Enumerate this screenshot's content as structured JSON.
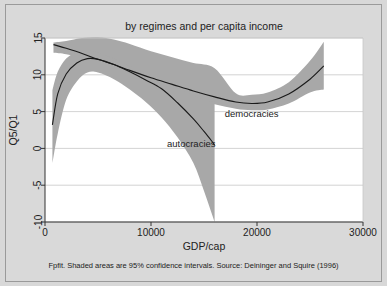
{
  "figure": {
    "title": "by regimes and per capita income",
    "note": "Fpfit. Shaded areas are 95% confidence intervals. Source: Deininger and Squire (1996)",
    "background_color": "#d9d9d9",
    "plot_background_color": "#ffffff",
    "band_color": "#a8a8a8",
    "line_color": "#1a1a1a",
    "grid_color": "#c8c8c8"
  },
  "chart_data": {
    "type": "line",
    "title": "by regimes and per capita income",
    "xlabel": "GDP/cap",
    "ylabel": "Q5/Q1",
    "xlim": [
      0,
      30000
    ],
    "ylim": [
      -10,
      15
    ],
    "xticks": [
      0,
      10000,
      20000,
      30000
    ],
    "xtick_labels": [
      "0",
      "10000",
      "20000",
      "30000"
    ],
    "yticks": [
      -10,
      -5,
      0,
      5,
      10,
      15
    ],
    "ytick_labels": [
      "-10",
      "-5",
      "0",
      "5",
      "10",
      "15"
    ],
    "grid": "horizontal",
    "legend": "inline-annotations",
    "annotations": [
      {
        "text": "democracies",
        "x": 19500,
        "y": 4.3
      },
      {
        "text": "autocracies",
        "x": 13800,
        "y": 0.2
      }
    ],
    "series": [
      {
        "name": "democracies",
        "label": "democracies",
        "x": [
          800,
          2000,
          3500,
          5000,
          6500,
          8000,
          10000,
          12000,
          14000,
          16000,
          18000,
          19500,
          21000,
          23000,
          25000,
          26300
        ],
        "y": [
          14.1,
          13.6,
          12.9,
          12.1,
          11.4,
          10.6,
          9.6,
          8.7,
          7.8,
          7.0,
          6.3,
          6.1,
          6.3,
          7.4,
          9.4,
          11.2
        ],
        "ci_upper": [
          14.4,
          14.6,
          15.0,
          15.1,
          14.8,
          14.2,
          13.2,
          12.4,
          11.6,
          10.9,
          7.5,
          7.3,
          7.6,
          9.0,
          11.9,
          14.5
        ],
        "ci_lower": [
          13.0,
          12.8,
          12.2,
          11.4,
          10.6,
          9.8,
          8.7,
          7.7,
          6.8,
          6.0,
          5.4,
          5.2,
          5.3,
          6.1,
          7.6,
          8.0
        ]
      },
      {
        "name": "autocracies",
        "label": "autocracies",
        "x": [
          700,
          1200,
          2000,
          3000,
          4000,
          5000,
          6500,
          8000,
          9500,
          11000,
          12500,
          14000,
          15000,
          16000
        ],
        "y": [
          3.2,
          7.4,
          10.1,
          11.6,
          12.2,
          12.1,
          11.4,
          10.4,
          9.3,
          8.1,
          6.2,
          4.0,
          2.3,
          0.5
        ],
        "ci_upper": [
          7.9,
          10.4,
          12.2,
          13.1,
          13.3,
          13.0,
          12.2,
          11.2,
          10.2,
          9.2,
          8.2,
          7.2,
          6.6,
          6.3
        ],
        "ci_lower": [
          -2.0,
          2.0,
          6.6,
          9.1,
          10.3,
          10.3,
          9.4,
          8.0,
          6.3,
          4.2,
          1.5,
          -2.0,
          -5.8,
          -10.0
        ]
      }
    ]
  }
}
